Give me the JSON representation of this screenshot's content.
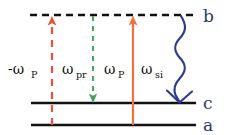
{
  "diagram": {
    "type": "energy-level-diagram",
    "background_color": "#ffffff",
    "levels": [
      {
        "id": "b",
        "label": "b",
        "style": "dashed",
        "y": 15,
        "x_start": 30,
        "x_end": 196,
        "color": "#111111"
      },
      {
        "id": "c",
        "label": "c",
        "style": "solid",
        "y": 103,
        "x_start": 31,
        "x_end": 196,
        "color": "#111111"
      },
      {
        "id": "a",
        "label": "a",
        "style": "solid",
        "y": 125,
        "x_start": 31,
        "x_end": 196,
        "color": "#111111"
      }
    ],
    "level_label_color": "#2b3a67",
    "transitions": [
      {
        "id": "pump-minus",
        "label_main": "-ω",
        "label_sub": "P",
        "color": "#e8513a",
        "style": "dashed",
        "direction": "up",
        "from_level": "a",
        "to_level": "b",
        "x": 52,
        "label_x": 8,
        "label_y": 74,
        "label_color": "#111111"
      },
      {
        "id": "probe",
        "label_main": "ω",
        "label_sub": "pr",
        "color": "#3fa45b",
        "style": "dashed",
        "direction": "down",
        "from_level": "b",
        "to_level": "c",
        "x": 93,
        "label_x": 62,
        "label_y": 74,
        "label_color": "#111111"
      },
      {
        "id": "pump",
        "label_main": "ω",
        "label_sub": "P",
        "color": "#f0733f",
        "style": "solid",
        "direction": "up",
        "from_level": "a",
        "to_level": "b",
        "x": 133,
        "label_x": 104,
        "label_y": 74,
        "label_color": "#111111"
      },
      {
        "id": "signal-idler",
        "label_main": "ω",
        "label_sub": "si",
        "color": "#2b3a8c",
        "style": "wavy",
        "direction": "down",
        "from_level": "b",
        "to_level": "c",
        "x": 180,
        "label_x": 140,
        "label_y": 74,
        "label_color": "#111111"
      }
    ],
    "label_positions": {
      "b": {
        "x": 203,
        "y": 22
      },
      "c": {
        "x": 203,
        "y": 108
      },
      "a": {
        "x": 203,
        "y": 130
      }
    }
  }
}
